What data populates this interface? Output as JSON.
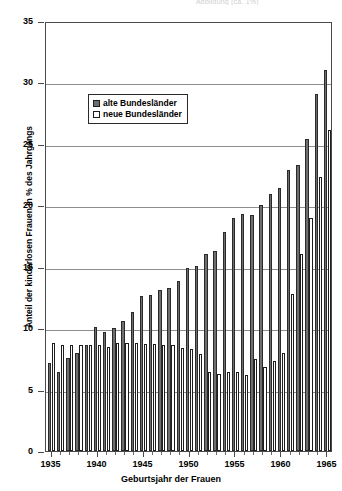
{
  "top_caption": "Abbildung (ca. 1%)",
  "chart_data": {
    "type": "bar",
    "title": "",
    "xlabel": "Geburtsjahr der Frauen",
    "ylabel": "Anteil der kinderlosen Frauen in % des Jahrgangs",
    "ylim": [
      0,
      35
    ],
    "yticks": [
      0,
      5,
      10,
      15,
      20,
      25,
      30,
      35
    ],
    "xticks": [
      1935,
      1940,
      1945,
      1950,
      1955,
      1960,
      1965
    ],
    "xlim": [
      1934.4,
      1965.6
    ],
    "grid": true,
    "legend_position": "upper-left-inside",
    "categories": [
      1935,
      1936,
      1937,
      1938,
      1939,
      1940,
      1941,
      1942,
      1943,
      1944,
      1945,
      1946,
      1947,
      1948,
      1949,
      1950,
      1951,
      1952,
      1953,
      1954,
      1955,
      1956,
      1957,
      1958,
      1959,
      1960,
      1961,
      1962,
      1963,
      1964,
      1965
    ],
    "series": [
      {
        "name": "alte Bundesländer",
        "color": "#6e6e6e",
        "values": [
          7.2,
          6.4,
          7.6,
          8.0,
          8.6,
          10.1,
          9.7,
          10.0,
          10.6,
          11.3,
          12.6,
          12.7,
          13.1,
          13.3,
          13.8,
          14.9,
          15.1,
          16.0,
          16.3,
          17.8,
          19.0,
          19.3,
          19.2,
          20.0,
          20.9,
          21.4,
          22.9,
          23.3,
          25.4,
          29.1,
          31.0
        ]
      },
      {
        "name": "neue Bundesländer",
        "color": "#ffffff",
        "values": [
          8.8,
          8.6,
          8.6,
          8.6,
          8.6,
          8.6,
          8.5,
          8.8,
          8.8,
          8.8,
          8.7,
          8.7,
          8.6,
          8.6,
          8.4,
          8.3,
          7.9,
          6.4,
          6.3,
          6.4,
          6.4,
          6.2,
          7.5,
          6.8,
          7.3,
          8.0,
          12.8,
          16.0,
          19.0,
          22.3,
          26.1
        ]
      }
    ]
  },
  "legend": {
    "items": [
      {
        "label": "alte Bundesländer",
        "swatch": "filled-gray"
      },
      {
        "label": "neue Bundesländer",
        "swatch": "hollow-white"
      }
    ]
  }
}
